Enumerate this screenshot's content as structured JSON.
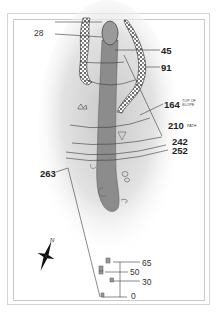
{
  "hole_map": {
    "green_marker": "28",
    "yardages": [
      {
        "value": "45"
      },
      {
        "value": "91"
      },
      {
        "value": "164",
        "note": "TOP OF SLOPE"
      },
      {
        "value": "210",
        "note": "PATH"
      },
      {
        "value": "242"
      },
      {
        "value": "252"
      },
      {
        "value": "263"
      }
    ],
    "tees": [
      {
        "value": "65"
      },
      {
        "value": "50"
      },
      {
        "value": "30"
      },
      {
        "value": "0"
      }
    ],
    "compass": {
      "north_label": "N"
    },
    "colors": {
      "fairway": "#8c8c8c",
      "green": "#9a9a9a",
      "trees": "#444444",
      "rough_glow": "#cfcfcf",
      "lines": "#3a3a3a"
    }
  }
}
